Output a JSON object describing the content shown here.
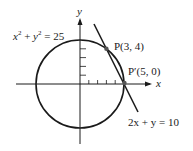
{
  "diagram": {
    "axes": {
      "x_label": "x",
      "y_label": "y"
    },
    "circle": {
      "equation": "x² + y² = 25",
      "eq_base_x": "x",
      "eq_base_y": "y",
      "eq_exp": "2",
      "eq_rest": "= 25",
      "radius": 5,
      "center": [
        0,
        0
      ]
    },
    "line": {
      "equation": "2x + y = 10",
      "eq_text": "2x + y = 10"
    },
    "points": [
      {
        "name": "P",
        "label": "P(3, 4)",
        "coords": [
          3,
          4
        ]
      },
      {
        "name": "P'",
        "label": "P′(5, 0)",
        "coords": [
          5,
          0
        ]
      }
    ],
    "ticks": {
      "x": [
        1,
        2,
        3,
        4,
        5
      ],
      "y": [
        1,
        2,
        3,
        4
      ]
    },
    "colors": {
      "stroke": "#1a1a1a",
      "point": "#555555"
    }
  }
}
